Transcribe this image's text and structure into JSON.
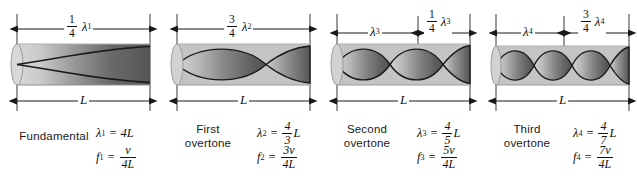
{
  "figure": {
    "background_color": "#ffffff",
    "tube_light_color": "#cfcfcf",
    "tube_dark_color": "#565656",
    "line_color": "#1a1a1a"
  },
  "panels": [
    {
      "id": "fundamental",
      "caption": "Fundamental",
      "top_dimension": {
        "fraction_num": "1",
        "fraction_den": "4",
        "symbol": "λ",
        "subscript": "1"
      },
      "bottom_dimension": {
        "label": "L"
      },
      "top_dimensions_extra": [],
      "wavelength_eq": {
        "lhs_symbol": "λ",
        "lhs_sub": "1",
        "equals": "=",
        "rhs_plain": "4L"
      },
      "frequency_eq": {
        "lhs_symbol": "f",
        "lhs_sub": "1",
        "equals": "=",
        "num": "v",
        "den": "4L"
      },
      "lobes": 0.5,
      "harmonic_number": 1
    },
    {
      "id": "first-overtone",
      "caption_line1": "First",
      "caption_line2": "overtone",
      "top_dimension": {
        "fraction_num": "3",
        "fraction_den": "4",
        "symbol": "λ",
        "subscript": "2"
      },
      "bottom_dimension": {
        "label": "L"
      },
      "top_dimensions_extra": [],
      "wavelength_eq": {
        "lhs_symbol": "λ",
        "lhs_sub": "2",
        "equals": "=",
        "num": "4",
        "den": "3",
        "suffix": "L"
      },
      "frequency_eq": {
        "lhs_symbol": "f",
        "lhs_sub": "2",
        "equals": "=",
        "num": "3v",
        "den": "4L"
      },
      "lobes": 1.5,
      "harmonic_number": 3
    },
    {
      "id": "second-overtone",
      "caption_line1": "Second",
      "caption_line2": "overtone",
      "top_dimension": {
        "symbol": "λ",
        "subscript": "3"
      },
      "top_dimension_2": {
        "fraction_num": "1",
        "fraction_den": "4",
        "symbol": "λ",
        "subscript": "3"
      },
      "bottom_dimension": {
        "label": "L"
      },
      "wavelength_eq": {
        "lhs_symbol": "λ",
        "lhs_sub": "3",
        "equals": "=",
        "num": "4",
        "den": "5",
        "suffix": "L"
      },
      "frequency_eq": {
        "lhs_symbol": "f",
        "lhs_sub": "3",
        "equals": "=",
        "num": "5v",
        "den": "4L"
      },
      "lobes": 2.5,
      "harmonic_number": 5
    },
    {
      "id": "third-overtone",
      "caption_line1": "Third",
      "caption_line2": "overtone",
      "top_dimension": {
        "symbol": "λ",
        "subscript": "4"
      },
      "top_dimension_2": {
        "fraction_num": "3",
        "fraction_den": "4",
        "symbol": "λ",
        "subscript": "4"
      },
      "bottom_dimension": {
        "label": "L"
      },
      "wavelength_eq": {
        "lhs_symbol": "λ",
        "lhs_sub": "4",
        "equals": "=",
        "num": "4",
        "den": "7",
        "suffix": "L"
      },
      "frequency_eq": {
        "lhs_symbol": "f",
        "lhs_sub": "4",
        "equals": "=",
        "num": "7v",
        "den": "4L"
      },
      "lobes": 3.5,
      "harmonic_number": 7
    }
  ]
}
